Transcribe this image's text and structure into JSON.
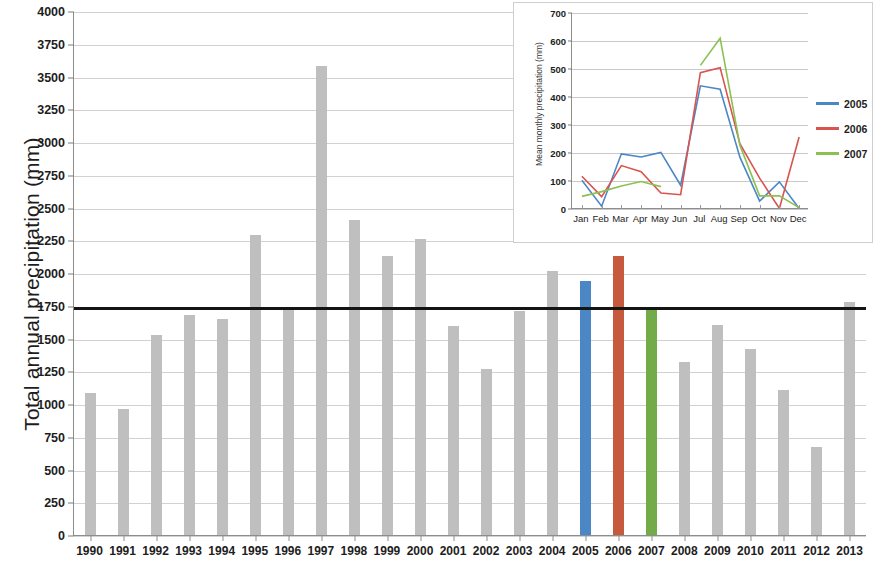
{
  "main": {
    "ylabel": "Total annual precipitation (mm)",
    "yticks": [
      "4000",
      "3750",
      "3500",
      "3250",
      "3000",
      "2750",
      "2500",
      "2250",
      "2000",
      "1750",
      "1500",
      "1250",
      "1000",
      "750",
      "500",
      "250",
      "0"
    ],
    "threshold_label": "1750"
  },
  "inset": {
    "ylabel": "Mean monthly precipitation (mm)",
    "yticks": [
      "700",
      "600",
      "500",
      "400",
      "300",
      "200",
      "100",
      "0"
    ],
    "legend": [
      {
        "label": "2005",
        "color": "#4a87c4"
      },
      {
        "label": "2006",
        "color": "#d9534f"
      },
      {
        "label": "2007",
        "color": "#8cc152"
      }
    ]
  },
  "chart_data": [
    {
      "type": "bar",
      "title": "",
      "xlabel": "",
      "ylabel": "Total annual precipitation (mm)",
      "ylim": [
        0,
        4000
      ],
      "ytick_step": 250,
      "grid": true,
      "categories": [
        "1990",
        "1991",
        "1992",
        "1993",
        "1994",
        "1995",
        "1996",
        "1997",
        "1998",
        "1999",
        "2000",
        "2001",
        "2002",
        "2003",
        "2004",
        "2005",
        "2006",
        "2007",
        "2008",
        "2009",
        "2010",
        "2011",
        "2012",
        "2013"
      ],
      "values": [
        1090,
        970,
        1535,
        1690,
        1660,
        2300,
        1745,
        3590,
        2415,
        2135,
        2265,
        1600,
        1275,
        1715,
        2025,
        1945,
        2140,
        1745,
        1325,
        1610,
        1430,
        1115,
        680,
        1790
      ],
      "bar_colors": [
        "#bfbfbf",
        "#bfbfbf",
        "#bfbfbf",
        "#bfbfbf",
        "#bfbfbf",
        "#bfbfbf",
        "#bfbfbf",
        "#bfbfbf",
        "#bfbfbf",
        "#bfbfbf",
        "#bfbfbf",
        "#bfbfbf",
        "#bfbfbf",
        "#bfbfbf",
        "#bfbfbf",
        "#4a87c4",
        "#c55a3c",
        "#72ab48",
        "#bfbfbf",
        "#bfbfbf",
        "#bfbfbf",
        "#bfbfbf",
        "#bfbfbf",
        "#bfbfbf"
      ],
      "reference_line": {
        "value": 1750,
        "color": "#141414",
        "label": "1750"
      }
    },
    {
      "type": "line",
      "title": "",
      "xlabel": "",
      "ylabel": "Mean monthly precipitation (mm)",
      "ylim": [
        0,
        700
      ],
      "ytick_step": 100,
      "grid": true,
      "legend_position": "right",
      "categories": [
        "Jan",
        "Feb",
        "Mar",
        "Apr",
        "May",
        "Jun",
        "Jul",
        "Aug",
        "Sep",
        "Oct",
        "Nov",
        "Dec"
      ],
      "series": [
        {
          "name": "2005",
          "color": "#4a87c4",
          "values": [
            103,
            10,
            197,
            186,
            202,
            85,
            440,
            428,
            185,
            28,
            97,
            2
          ]
        },
        {
          "name": "2006",
          "color": "#d9534f",
          "values": [
            117,
            44,
            155,
            133,
            57,
            51,
            487,
            505,
            233,
            110,
            2,
            257
          ]
        },
        {
          "name": "2007",
          "color": "#8cc152",
          "values": [
            45,
            62,
            82,
            98,
            80,
            null,
            513,
            610,
            228,
            47,
            47,
            5
          ]
        }
      ]
    }
  ]
}
